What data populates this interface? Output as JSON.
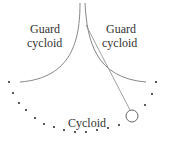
{
  "labels": {
    "left_guard_line1": "Guard",
    "left_guard_line2": "cycloid",
    "right_guard_line1": "Guard",
    "right_guard_line2": "cycloid",
    "cycloid": "Cycloid"
  },
  "colors": {
    "curve": "#888888",
    "dots": "#222222",
    "text": "#333333"
  }
}
